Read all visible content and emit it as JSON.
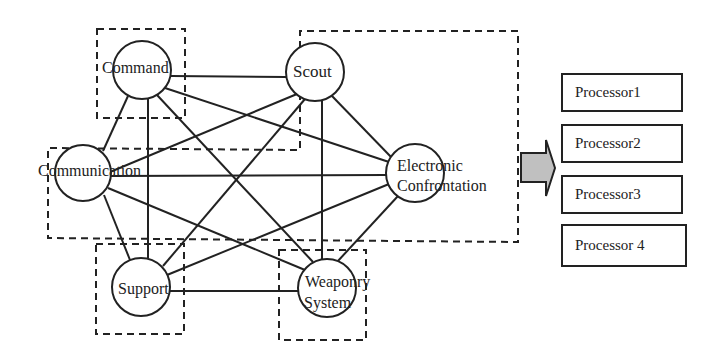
{
  "diagram": {
    "nodes": [
      {
        "id": "command",
        "label": "Command"
      },
      {
        "id": "scout",
        "label": "Scout"
      },
      {
        "id": "communication",
        "label": "Communication"
      },
      {
        "id": "electronic",
        "label": "Electronic",
        "label2": "Confrontation"
      },
      {
        "id": "support",
        "label": "Support"
      },
      {
        "id": "weaponry",
        "label": "Weaponry",
        "label2": "System"
      }
    ],
    "processors": [
      {
        "label": "Processor1"
      },
      {
        "label": "Processor2"
      },
      {
        "label": "Processor3"
      },
      {
        "label": "Processor 4"
      }
    ],
    "edges": [
      [
        "command",
        "scout"
      ],
      [
        "command",
        "communication"
      ],
      [
        "command",
        "support"
      ],
      [
        "command",
        "weaponry"
      ],
      [
        "command",
        "electronic"
      ],
      [
        "scout",
        "communication"
      ],
      [
        "scout",
        "support"
      ],
      [
        "scout",
        "weaponry"
      ],
      [
        "scout",
        "electronic"
      ],
      [
        "communication",
        "electronic"
      ],
      [
        "communication",
        "support"
      ],
      [
        "communication",
        "weaponry"
      ],
      [
        "electronic",
        "support"
      ],
      [
        "electronic",
        "weaponry"
      ],
      [
        "support",
        "weaponry"
      ]
    ],
    "arrow": {
      "fill": "#c0c0c0"
    }
  }
}
